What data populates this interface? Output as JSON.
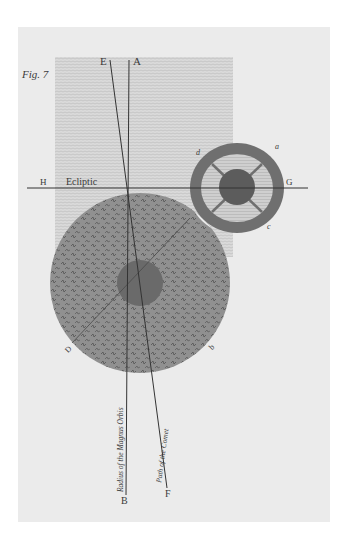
{
  "figure": {
    "label": "Fig. 7",
    "ecliptic_label": "Ecliptic",
    "points": {
      "A": "A",
      "B": "B",
      "E": "E",
      "F": "F",
      "G": "G",
      "H": "H",
      "a": "a",
      "b": "b",
      "c": "c",
      "d": "d",
      "D": "D"
    },
    "line_captions": {
      "radius": "Radius of the Magnus Orbis",
      "path": "Path of the Comet"
    },
    "colors": {
      "page": "#ffffff",
      "plate": "#ebebeb",
      "hatch_region": "#d9d9d9",
      "large_disc": "#8e8e8e",
      "large_core": "#6a6a6a",
      "ring_outer": "#6f6f6f",
      "ring_inner": "#c8c8c8",
      "small_core": "#5c5c5c",
      "ink": "#333333"
    }
  }
}
